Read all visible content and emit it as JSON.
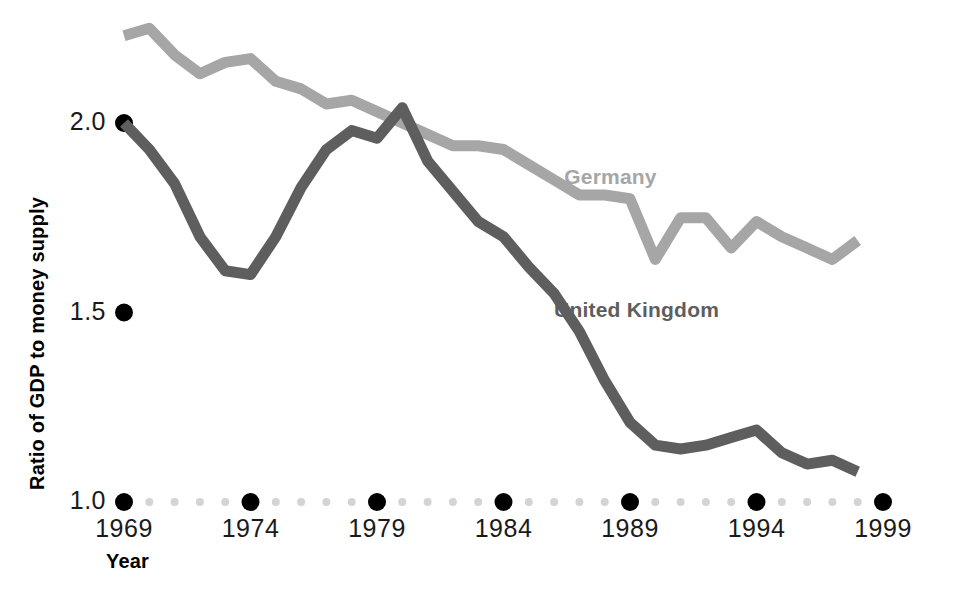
{
  "chart_data": {
    "type": "line",
    "title": "",
    "subtitle": "",
    "xlabel": "Year",
    "ylabel": "Ratio of GDP to money supply",
    "xlim": [
      1969,
      1999
    ],
    "ylim": [
      1.0,
      2.3
    ],
    "grid": false,
    "legend_position": "inline-annotation",
    "x_tick_labels": [
      "1969",
      "1974",
      "1979",
      "1984",
      "1989",
      "1994",
      "1999"
    ],
    "x_tick_values": [
      1969,
      1974,
      1979,
      1984,
      1989,
      1994,
      1999
    ],
    "y_tick_labels": [
      "2.0",
      "1.5",
      "1.0"
    ],
    "y_tick_values": [
      2.0,
      1.5,
      1.0
    ],
    "x": [
      1969,
      1970,
      1971,
      1972,
      1973,
      1974,
      1975,
      1976,
      1977,
      1978,
      1979,
      1980,
      1981,
      1982,
      1983,
      1984,
      1985,
      1986,
      1987,
      1988,
      1989,
      1990,
      1991,
      1992,
      1993,
      1994,
      1995,
      1996,
      1997,
      1998
    ],
    "series": [
      {
        "name": "Germany",
        "color": "#a6a6a6",
        "label_x": 1986.4,
        "label_y": 1.855,
        "values": [
          2.23,
          2.25,
          2.18,
          2.13,
          2.16,
          2.17,
          2.11,
          2.09,
          2.05,
          2.06,
          2.03,
          2.0,
          1.97,
          1.94,
          1.94,
          1.93,
          1.89,
          1.85,
          1.81,
          1.81,
          1.8,
          1.64,
          1.75,
          1.75,
          1.67,
          1.74,
          1.7,
          1.67,
          1.64,
          1.69
        ]
      },
      {
        "name": "United Kingdom",
        "color": "#5e5e5e",
        "label_x": 1986.0,
        "label_y": 1.505,
        "values": [
          2.0,
          1.93,
          1.84,
          1.7,
          1.61,
          1.6,
          1.7,
          1.83,
          1.93,
          1.98,
          1.96,
          2.04,
          1.9,
          1.82,
          1.74,
          1.7,
          1.62,
          1.55,
          1.45,
          1.32,
          1.21,
          1.15,
          1.14,
          1.15,
          1.17,
          1.19,
          1.13,
          1.1,
          1.11,
          1.08
        ]
      }
    ]
  },
  "axis": {
    "y_labels": [
      "2.0",
      "1.5",
      "1.0"
    ],
    "x_labels": [
      "1969",
      "1974",
      "1979",
      "1984",
      "1989",
      "1994",
      "1999"
    ],
    "y_title": "Ratio of GDP to money supply",
    "x_title": "Year"
  },
  "annotations": {
    "germany_label": "Germany",
    "uk_label": "United Kingdom"
  },
  "style": {
    "background": "#ffffff",
    "germany_color": "#a6a6a6",
    "uk_color": "#5e5e5e",
    "tick_major_color": "#000000",
    "tick_minor_color": "#d4d4d4",
    "text_color": "#1a1a1a"
  }
}
